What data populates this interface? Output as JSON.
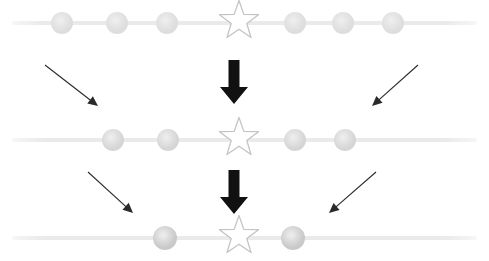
{
  "diagram": {
    "canvas": {
      "width": 489,
      "height": 261,
      "background": "#ffffff"
    },
    "colors": {
      "track_line": "#eaeaea",
      "track_line_edge": "#f6f6f6",
      "circle_light": "#dddddd",
      "circle_mid": "#d5d5d5",
      "circle_dark": "#c9c9c9",
      "star_outline": "#c4c4c4",
      "star_fill": "#ffffff",
      "thick_arrow": "#111111",
      "thin_arrow": "#2a2a2a"
    },
    "rows": [
      {
        "id": "row-top",
        "label": "Top row",
        "y": 23,
        "line": {
          "x1": 12,
          "x2": 477,
          "thickness": 4
        },
        "nodes": [
          {
            "type": "circle",
            "x": 62,
            "r": 11,
            "shade": "circle_light"
          },
          {
            "type": "circle",
            "x": 117,
            "r": 11,
            "shade": "circle_light"
          },
          {
            "type": "circle",
            "x": 167,
            "r": 11,
            "shade": "circle_light"
          },
          {
            "type": "star",
            "x": 239,
            "size": 44,
            "shade": "star_outline"
          },
          {
            "type": "circle",
            "x": 295,
            "r": 11,
            "shade": "circle_light"
          },
          {
            "type": "circle",
            "x": 343,
            "r": 11,
            "shade": "circle_light"
          },
          {
            "type": "circle",
            "x": 393,
            "r": 11,
            "shade": "circle_light"
          }
        ]
      },
      {
        "id": "row-middle",
        "label": "Middle row",
        "y": 140,
        "line": {
          "x1": 12,
          "x2": 477,
          "thickness": 4
        },
        "nodes": [
          {
            "type": "circle",
            "x": 113,
            "r": 11,
            "shade": "circle_mid"
          },
          {
            "type": "circle",
            "x": 168,
            "r": 11,
            "shade": "circle_mid"
          },
          {
            "type": "star",
            "x": 239,
            "size": 44,
            "shade": "star_outline"
          },
          {
            "type": "circle",
            "x": 295,
            "r": 11,
            "shade": "circle_mid"
          },
          {
            "type": "circle",
            "x": 345,
            "r": 11,
            "shade": "circle_mid"
          }
        ]
      },
      {
        "id": "row-bottom",
        "label": "Bottom row",
        "y": 238,
        "line": {
          "x1": 12,
          "x2": 477,
          "thickness": 4
        },
        "nodes": [
          {
            "type": "circle",
            "x": 165,
            "r": 12,
            "shade": "circle_dark"
          },
          {
            "type": "star",
            "x": 239,
            "size": 44,
            "shade": "star_outline"
          },
          {
            "type": "circle",
            "x": 293,
            "r": 12,
            "shade": "circle_dark"
          }
        ]
      }
    ],
    "arrows": {
      "thick": [
        {
          "id": "thick-arrow-upper",
          "x": 234,
          "y1": 60,
          "y2": 104,
          "shaft_width": 11,
          "head_width": 28,
          "head_height": 17
        },
        {
          "id": "thick-arrow-lower",
          "x": 234,
          "y1": 170,
          "y2": 214,
          "shaft_width": 11,
          "head_width": 28,
          "head_height": 17
        }
      ],
      "thin": [
        {
          "id": "thin-arrow-upper-left",
          "x1": 45,
          "y1": 65,
          "x2": 98,
          "y2": 106
        },
        {
          "id": "thin-arrow-upper-right",
          "x1": 418,
          "y1": 65,
          "x2": 372,
          "y2": 106
        },
        {
          "id": "thin-arrow-lower-left",
          "x1": 88,
          "y1": 172,
          "x2": 133,
          "y2": 213
        },
        {
          "id": "thin-arrow-lower-right",
          "x1": 376,
          "y1": 172,
          "x2": 329,
          "y2": 213
        }
      ]
    }
  }
}
